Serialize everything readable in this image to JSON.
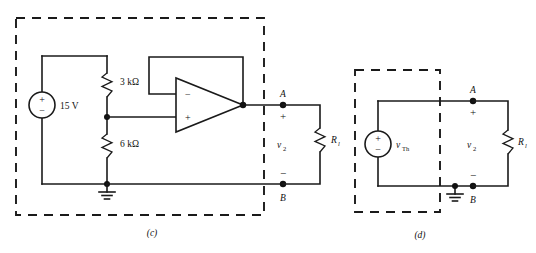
{
  "figure": {
    "background_color": "#ffffff",
    "line_color": "#1a1a1a"
  },
  "circuit_c": {
    "caption": "(c)",
    "dashed_box_label": "source-network-boundary",
    "source": {
      "name": "dc-voltage-source",
      "label": "15 V",
      "plus": "+",
      "minus": "−"
    },
    "resistors": [
      {
        "name": "resistor-r1",
        "label": "3 kΩ"
      },
      {
        "name": "resistor-r2",
        "label": "6 kΩ"
      }
    ],
    "opamp": {
      "name": "operational-amplifier",
      "inverting_input": "−",
      "noninverting_input": "+"
    },
    "ground": {
      "name": "ground-symbol"
    },
    "terminals": {
      "top": "A",
      "bottom": "B",
      "plus": "+",
      "minus": "−"
    },
    "output_voltage": {
      "symbol": "v",
      "subscript": "2"
    },
    "load": {
      "name": "load-resistor",
      "symbol": "R",
      "subscript": "l"
    }
  },
  "circuit_d": {
    "caption": "(d)",
    "dashed_box_label": "thevenin-equivalent-boundary",
    "source": {
      "name": "thevenin-voltage-source",
      "symbol": "v",
      "subscript": "Th",
      "plus": "+",
      "minus": "−"
    },
    "ground": {
      "name": "ground-symbol"
    },
    "terminals": {
      "top": "A",
      "bottom": "B",
      "plus": "+",
      "minus": "−"
    },
    "output_voltage": {
      "symbol": "v",
      "subscript": "2"
    },
    "load": {
      "name": "load-resistor",
      "symbol": "R",
      "subscript": "l"
    }
  }
}
